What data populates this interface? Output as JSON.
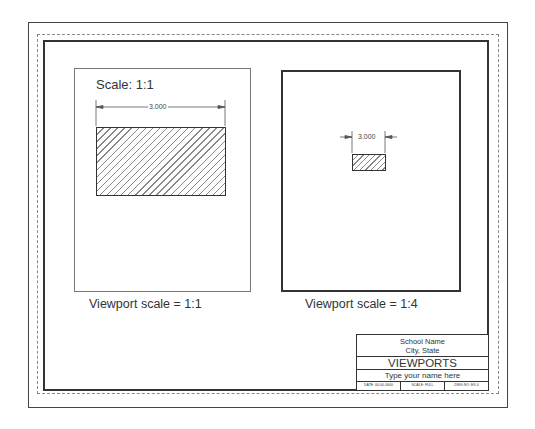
{
  "sheet": {
    "title": "VIEWPORTS",
    "borders": {
      "outer": "#444444",
      "dashed": "#888888",
      "inner": "#333333"
    }
  },
  "left_viewport": {
    "scale_label": "Scale: 1:1",
    "dimension": "3.000",
    "caption": "Viewport scale = 1:1"
  },
  "right_viewport": {
    "dimension": "3.000",
    "caption": "Viewport scale = 1:4"
  },
  "title_block": {
    "school_name": "School Name",
    "city_state": "City, State",
    "title": "VIEWPORTS",
    "name_placeholder": "Type your name here",
    "date": "DATE: 00-00-0000",
    "scale": "SCALE: FULL",
    "dwg_no": "DWG NO: EX-0"
  }
}
